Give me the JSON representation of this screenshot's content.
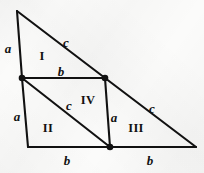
{
  "figure": {
    "kind": "geometry-diagram",
    "background_color": "#fbfbfa",
    "stroke_color": "#111111",
    "vertex_dot_color": "#111111",
    "canvas": {
      "width": 204,
      "height": 173
    }
  },
  "points": {
    "apex": {
      "name": "apex",
      "x": 17,
      "y": 11,
      "dot": false
    },
    "left_mid": {
      "name": "left-mid",
      "x": 22,
      "y": 78,
      "dot": true
    },
    "upper_right": {
      "name": "upper-right",
      "x": 105,
      "y": 78,
      "dot": true
    },
    "bottom_left": {
      "name": "bottom-left",
      "x": 28,
      "y": 147,
      "dot": false
    },
    "bottom_mid": {
      "name": "bottom-mid",
      "x": 110,
      "y": 147,
      "dot": true
    },
    "bottom_right": {
      "name": "bottom-right",
      "x": 196,
      "y": 147,
      "dot": false
    }
  },
  "segments": [
    {
      "name": "left-upper-edge",
      "from": "apex",
      "to": "left_mid",
      "width": 2.1
    },
    {
      "name": "hypotenuse-upper",
      "from": "apex",
      "to": "upper_right",
      "width": 2.1
    },
    {
      "name": "hypotenuse-lower",
      "from": "upper_right",
      "to": "bottom_right",
      "width": 2.1
    },
    {
      "name": "base-left",
      "from": "bottom_left",
      "to": "bottom_mid",
      "width": 2.1
    },
    {
      "name": "base-right",
      "from": "bottom_mid",
      "to": "bottom_right",
      "width": 2.1
    },
    {
      "name": "parallelogram-top",
      "from": "left_mid",
      "to": "upper_right",
      "width": 2.1
    },
    {
      "name": "parallelogram-right",
      "from": "upper_right",
      "to": "bottom_mid",
      "width": 2.1
    },
    {
      "name": "left-lower-edge",
      "from": "left_mid",
      "to": "bottom_left",
      "width": 2.1
    },
    {
      "name": "inner-diagonal",
      "from": "left_mid",
      "to": "bottom_mid",
      "width": 2.1
    }
  ],
  "labels": {
    "sides": [
      {
        "id": "a-top-left",
        "text": "a",
        "x": 8,
        "y": 48
      },
      {
        "id": "c-top",
        "text": "c",
        "x": 66,
        "y": 42
      },
      {
        "id": "b-middle",
        "text": "b",
        "x": 61,
        "y": 71
      },
      {
        "id": "a-left-lower",
        "text": "a",
        "x": 17,
        "y": 116
      },
      {
        "id": "c-inner",
        "text": "c",
        "x": 69,
        "y": 105
      },
      {
        "id": "a-inner-right",
        "text": "a",
        "x": 114,
        "y": 117
      },
      {
        "id": "c-right",
        "text": "c",
        "x": 152,
        "y": 108
      },
      {
        "id": "b-bottom-left",
        "text": "b",
        "x": 67,
        "y": 160
      },
      {
        "id": "b-bottom-right",
        "text": "b",
        "x": 150,
        "y": 160
      }
    ],
    "regions": [
      {
        "id": "region-I",
        "text": "I",
        "x": 42,
        "y": 56
      },
      {
        "id": "region-IV",
        "text": "IV",
        "x": 88,
        "y": 100
      },
      {
        "id": "region-II",
        "text": "II",
        "x": 48,
        "y": 128
      },
      {
        "id": "region-III",
        "text": "III",
        "x": 136,
        "y": 128
      }
    ]
  }
}
